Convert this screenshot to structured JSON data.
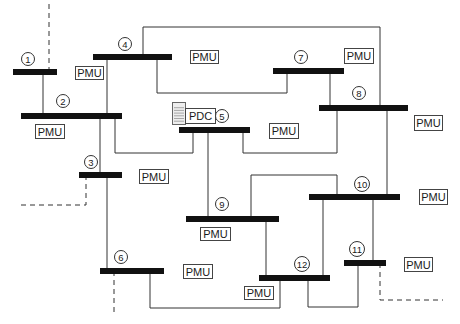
{
  "diagram": {
    "colors": {
      "bus": "#111111",
      "line": "#333333",
      "box_border": "#444444",
      "text": "#1a1a1a",
      "pdc_fill": "#eeeeee"
    },
    "buses": [
      {
        "id": "1",
        "label": "1",
        "x1": 13,
        "x2": 57,
        "y": 72,
        "lx": 28,
        "ly": 59
      },
      {
        "id": "2",
        "label": "2",
        "x1": 21,
        "x2": 122,
        "y": 116,
        "lx": 63,
        "ly": 101
      },
      {
        "id": "3",
        "label": "3",
        "x1": 79,
        "x2": 122,
        "y": 175,
        "lx": 91,
        "ly": 162
      },
      {
        "id": "4",
        "label": "4",
        "x1": 93,
        "x2": 172,
        "y": 57,
        "lx": 125,
        "ly": 44
      },
      {
        "id": "5",
        "label": "5",
        "x1": 179,
        "x2": 250,
        "y": 130,
        "lx": 222,
        "ly": 116
      },
      {
        "id": "6",
        "label": "6",
        "x1": 100,
        "x2": 164,
        "y": 271,
        "lx": 121,
        "ly": 257
      },
      {
        "id": "7",
        "label": "7",
        "x1": 273,
        "x2": 344,
        "y": 71,
        "lx": 301,
        "ly": 57
      },
      {
        "id": "8",
        "label": "8",
        "x1": 319,
        "x2": 408,
        "y": 108,
        "lx": 359,
        "ly": 93
      },
      {
        "id": "9",
        "label": "9",
        "x1": 186,
        "x2": 279,
        "y": 219,
        "lx": 222,
        "ly": 204
      },
      {
        "id": "10",
        "label": "10",
        "x1": 309,
        "x2": 400,
        "y": 197,
        "lx": 362,
        "ly": 184
      },
      {
        "id": "11",
        "label": "11",
        "x1": 344,
        "x2": 386,
        "y": 263,
        "lx": 357,
        "ly": 249
      },
      {
        "id": "12",
        "label": "12",
        "x1": 259,
        "x2": 330,
        "y": 278,
        "lx": 302,
        "ly": 264
      }
    ],
    "lines": [
      {
        "from": "1",
        "to": "2",
        "points": "43,72 43,116"
      },
      {
        "from": "4",
        "to": "2",
        "points": "107,57 107,116"
      },
      {
        "from": "4",
        "to": "8",
        "points": "143,57 143,27 380,27 380,108"
      },
      {
        "from": "4",
        "to": "7",
        "points": "157,57 157,93 287,93 287,71"
      },
      {
        "from": "7",
        "to": "8",
        "points": "330,71 330,108"
      },
      {
        "from": "2",
        "to": "5",
        "points": "115,116 115,153 193,153 193,130"
      },
      {
        "from": "2",
        "to": "3",
        "points": "100,116 100,175"
      },
      {
        "from": "5",
        "to": "8",
        "points": "243,130 243,153 337,153 337,108"
      },
      {
        "from": "5",
        "to": "9",
        "points": "208,130 208,219"
      },
      {
        "from": "3",
        "to": "6",
        "points": "107,175 107,271"
      },
      {
        "from": "6",
        "to": "12",
        "points": "150,271 150,308 280,308 280,278"
      },
      {
        "from": "9",
        "to": "10",
        "points": "251,219 251,175 337,175 337,197"
      },
      {
        "from": "9",
        "to": "12",
        "points": "266,219 266,278"
      },
      {
        "from": "8",
        "to": "10",
        "points": "387,108 387,197"
      },
      {
        "from": "10",
        "to": "12",
        "points": "323,197 323,278"
      },
      {
        "from": "10",
        "to": "11",
        "points": "373,197 373,263"
      },
      {
        "from": "12",
        "to": "11",
        "points": "308,278 308,307 358,307 358,263"
      }
    ],
    "external_lines": [
      {
        "bus": "1",
        "points": "49,72 49,4"
      },
      {
        "bus": "3",
        "points": "86,175 86,205 21,205"
      },
      {
        "bus": "6",
        "points": "114,271 114,312"
      },
      {
        "bus": "11",
        "points": "380,263 380,300 443,300"
      }
    ],
    "pmus": [
      {
        "bus": "1-2",
        "text": "PMU",
        "x": 35,
        "y": 124,
        "w": 29,
        "h": 14
      },
      {
        "bus": "4",
        "text": "PMU",
        "x": 75,
        "y": 66,
        "w": 28,
        "h": 13
      },
      {
        "bus": "4-right",
        "text": "PMU",
        "x": 190,
        "y": 50,
        "w": 28,
        "h": 13
      },
      {
        "bus": "7",
        "text": "PMU",
        "x": 344,
        "y": 48,
        "w": 29,
        "h": 15
      },
      {
        "bus": "8",
        "text": "PMU",
        "x": 414,
        "y": 115,
        "w": 28,
        "h": 15
      },
      {
        "bus": "5",
        "text": "PMU",
        "x": 269,
        "y": 123,
        "w": 29,
        "h": 15
      },
      {
        "bus": "3",
        "text": "PMU",
        "x": 139,
        "y": 169,
        "w": 29,
        "h": 14
      },
      {
        "bus": "9",
        "text": "PMU",
        "x": 200,
        "y": 227,
        "w": 30,
        "h": 13
      },
      {
        "bus": "10",
        "text": "PMU",
        "x": 419,
        "y": 189,
        "w": 28,
        "h": 15
      },
      {
        "bus": "6",
        "text": "PMU",
        "x": 183,
        "y": 264,
        "w": 29,
        "h": 14
      },
      {
        "bus": "11",
        "text": "PMU",
        "x": 404,
        "y": 257,
        "w": 28,
        "h": 14
      },
      {
        "bus": "12",
        "text": "PMU",
        "x": 244,
        "y": 286,
        "w": 29,
        "h": 13
      }
    ],
    "pdc": {
      "text": "PDC",
      "x": 185,
      "y": 108,
      "w": 30,
      "h": 15,
      "icon_x": 172,
      "icon_y": 102,
      "icon_w": 13,
      "icon_h": 22
    }
  }
}
